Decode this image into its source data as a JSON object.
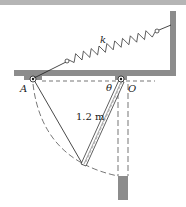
{
  "diagram": {
    "labels": {
      "spring": "k",
      "pivot_left": "A",
      "pivot_right": "O",
      "angle": "θ",
      "length": "1.2 m"
    },
    "colors": {
      "structure": "#8c8c8c",
      "ink": "#1a1a1a",
      "top_band": "#b5b5b5"
    }
  }
}
